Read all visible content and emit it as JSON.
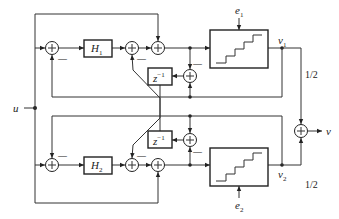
{
  "diagram": {
    "input_label": "u",
    "output_label": "v",
    "blocks": {
      "h1": "H",
      "h1_sub": "1",
      "h2": "H",
      "h2_sub": "2",
      "delay_top": "z",
      "delay_top_exp": "−1",
      "delay_bottom": "z",
      "delay_bottom_exp": "−1"
    },
    "quantizers": {
      "top_error": "e",
      "top_error_sub": "1",
      "bottom_error": "e",
      "bottom_error_sub": "2"
    },
    "nodes": {
      "v1": "v",
      "v1_sub": "1",
      "v2": "v",
      "v2_sub": "2"
    },
    "gains": {
      "top": "1/2",
      "bottom": "1/2"
    },
    "sum_symbol": "+",
    "minus_sign": "—"
  }
}
